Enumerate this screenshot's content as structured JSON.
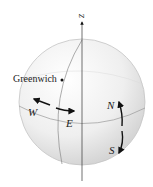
{
  "diagram": {
    "type": "globe-with-axis",
    "axis_label": "z",
    "point_label": "Greenwich",
    "directions": {
      "west": "W",
      "east": "E",
      "north": "N",
      "south": "S"
    },
    "colors": {
      "sphere_fill": "#ececec",
      "sphere_edge": "#bdbdbd",
      "lines": "#555555",
      "arrows": "#111111"
    }
  }
}
